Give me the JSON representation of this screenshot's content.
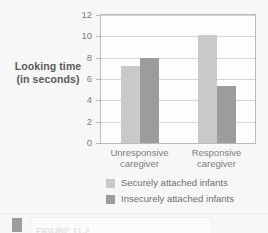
{
  "chart_data": {
    "type": "bar",
    "title": "",
    "xlabel": "",
    "ylabel": "Looking time (in seconds)",
    "ylabel_line1": "Looking time",
    "ylabel_line2": "(in seconds)",
    "categories": [
      "Unresponsive caregiver",
      "Responsive caregiver"
    ],
    "category_lines": [
      {
        "line1": "Unresponsive",
        "line2": "caregiver"
      },
      {
        "line1": "Responsive",
        "line2": "caregiver"
      }
    ],
    "series": [
      {
        "name": "Securely attached infants",
        "color": "#c9c9c9",
        "values": [
          7.2,
          10.1
        ]
      },
      {
        "name": "Insecurely attached infants",
        "color": "#9c9c9c",
        "values": [
          8.0,
          5.3
        ]
      }
    ],
    "ylim": [
      0,
      12
    ],
    "ytick_values": [
      0,
      2,
      4,
      6,
      8,
      10,
      12
    ],
    "ytick_labels": [
      "0",
      "2",
      "4",
      "6",
      "8",
      "10",
      "12"
    ],
    "grid": true,
    "legend_position": "bottom-center"
  },
  "legend": {
    "entries": [
      {
        "label": "Securely attached infants",
        "color": "#c9c9c9"
      },
      {
        "label": "Insecurely attached infants",
        "color": "#9c9c9c"
      }
    ]
  },
  "caption": {
    "text": "FIGURE 11.2"
  },
  "colors": {
    "background": "#f7f7f7",
    "plot_background": "#fdfdfd",
    "axis": "#b9b9b9",
    "gridline": "#d6d6d6",
    "tick_text": "#7d7d7d",
    "title_text": "#5a5a5a",
    "series_light": "#c9c9c9",
    "series_dark": "#9c9c9c"
  }
}
